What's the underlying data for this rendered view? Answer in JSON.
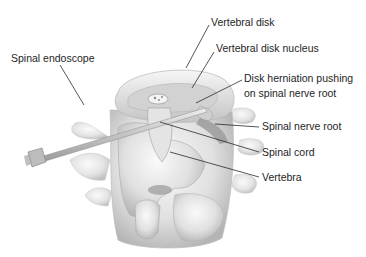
{
  "diagram": {
    "labels": {
      "spinal_endoscope": "Spinal endoscope",
      "vertebral_disk": "Vertebral disk",
      "vertebral_disk_nucleus": "Vertebral disk nucleus",
      "disk_herniation_line1": "Disk herniation pushing",
      "disk_herniation_line2": "on spinal nerve root",
      "spinal_nerve_root": "Spinal nerve root",
      "spinal_cord": "Spinal cord",
      "vertebra": "Vertebra"
    },
    "colors": {
      "bone_light": "#f2f2f2",
      "bone_mid": "#d6d6d6",
      "bone_dark": "#a8a8a8",
      "leader_line": "#2a2a2a",
      "text": "#1e1e1e"
    }
  }
}
